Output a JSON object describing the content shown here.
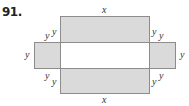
{
  "problem_number": "91.",
  "labels": {
    "top": "x",
    "bottom": "x",
    "left": "y",
    "right": "y",
    "top_left_outer": "y",
    "top_left_inner": "y",
    "top_right_inner": "y",
    "top_right_outer": "y",
    "bottom_left_outer": "y",
    "bottom_left_inner": "y",
    "bottom_right_inner": "y",
    "bottom_right_outer": "y"
  },
  "colors": {
    "fill": "#dadada",
    "stroke": "#8c8c8c",
    "center": "#ffffff"
  }
}
